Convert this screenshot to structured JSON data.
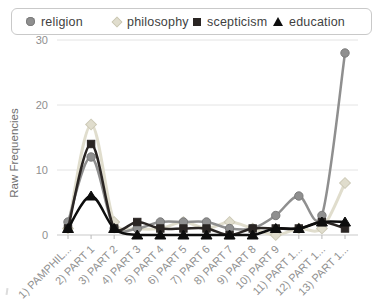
{
  "y_axis": {
    "title": "Raw Frequencies",
    "ticks": [
      "0",
      "10",
      "20",
      "30"
    ]
  },
  "chart_data": {
    "type": "line",
    "title": "",
    "xlabel": "",
    "ylabel": "Raw Frequencies",
    "ylim": [
      0,
      30
    ],
    "yticks": [
      0,
      10,
      20,
      30
    ],
    "grid": true,
    "legend_position": "top",
    "categories": [
      "1) PAMPHIL...",
      "2) PART 1",
      "3) PART 2",
      "4) PART 3",
      "5) PART 4",
      "6) PART 5",
      "7) PART 6",
      "8) PART 7",
      "9) PART 8",
      "10) PART 9",
      "11) PART 1...",
      "12) PART 1...",
      "13) PART 1..."
    ],
    "series": [
      {
        "name": "religion",
        "marker": "circle",
        "color": "#8f8f8f",
        "edge": "#7b7b7b",
        "values": [
          2,
          12,
          1,
          1,
          2,
          2,
          2,
          1,
          1,
          3,
          6,
          3,
          28
        ]
      },
      {
        "name": "philosophy",
        "marker": "diamond",
        "color": "#e0ddcd",
        "edge": "#ccc9b6",
        "values": [
          1,
          17,
          2,
          1,
          1,
          2,
          1,
          2,
          1,
          0,
          1,
          1,
          8
        ]
      },
      {
        "name": "scepticism",
        "marker": "square",
        "color": "#2a2523",
        "edge": "#2a2523",
        "values": [
          1,
          14,
          1,
          2,
          1,
          1,
          1,
          0,
          1,
          1,
          1,
          2,
          1
        ]
      },
      {
        "name": "education",
        "marker": "triangle",
        "color": "#0d0d0d",
        "edge": "#0d0d0d",
        "values": [
          1,
          6,
          1,
          0,
          0,
          0,
          0,
          0,
          0,
          1,
          1,
          2,
          2
        ]
      }
    ]
  }
}
